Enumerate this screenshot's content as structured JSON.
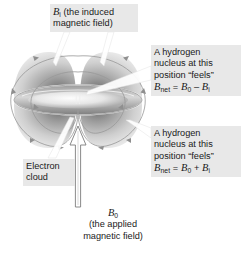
{
  "figure": {
    "type": "science-diagram",
    "background_color": "#ffffff",
    "label_box_color": "#e8e8e8",
    "text_color": "#1a1a1a"
  },
  "labels": {
    "induced_field": {
      "symbol": "B",
      "symbol_sub": "i",
      "text": "(the induced",
      "text_line2": "magnetic field)"
    },
    "hydrogen_minus": {
      "line1": "A hydrogen",
      "line2": "nucleus at this",
      "line3": "position “feels”",
      "eq_symbol": "B",
      "eq_sub": "net",
      "eq_rhs_1": "B",
      "eq_rhs_1_sub": "0",
      "eq_operator": "–",
      "eq_rhs_2": "B",
      "eq_rhs_2_sub": "i"
    },
    "hydrogen_plus": {
      "line1": "A hydrogen",
      "line2": "nucleus at this",
      "line3": "position “feels”",
      "eq_symbol": "B",
      "eq_sub": "net",
      "eq_rhs_1": "B",
      "eq_rhs_1_sub": "0",
      "eq_operator": "+",
      "eq_rhs_2": "B",
      "eq_rhs_2_sub": "i"
    },
    "electron_cloud": {
      "line1": "Electron",
      "line2": "cloud"
    },
    "applied_field": {
      "symbol": "B",
      "symbol_sub": "0",
      "line1": "(the applied",
      "line2": "magnetic field)"
    }
  },
  "graphic_elements": {
    "electron_cloud_lobes": "four gray shaded lobes forming a torus-like cloud",
    "electron_ring": "bright horizontal ellipse through the cloud center",
    "field_lines": "closed curved induced-field lines with arrowheads circulating around the cloud",
    "applied_field_arrow": "hollow outlined vertical arrow pointing upward into the cloud",
    "leader_lines": "white callout leaders connecting labels to diagram features"
  },
  "colors": {
    "cloud_dark": "#8e8e8e",
    "cloud_mid": "#b8b8b8",
    "cloud_light": "#f2f2f2",
    "field_line": "#9a9a9a",
    "ring_edge": "#6f6f6f",
    "arrow_outline": "#7a7a7a"
  }
}
